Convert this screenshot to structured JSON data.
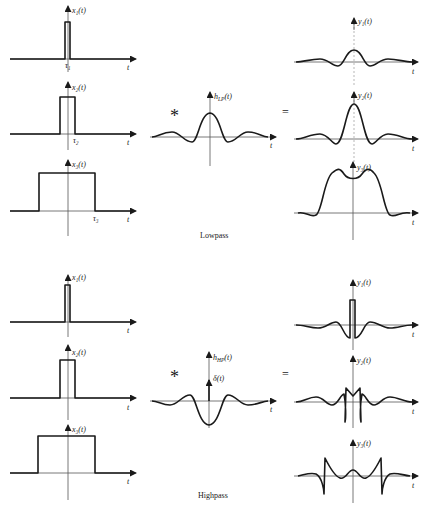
{
  "sections": [
    {
      "caption": "Lowpass",
      "inputs": [
        {
          "label": "x₁(t)",
          "tau_label": "τ₁",
          "t_label": "t"
        },
        {
          "label": "x₂(t)",
          "tau_label": "τ₂",
          "t_label": "t"
        },
        {
          "label": "x₃(t)",
          "tau_label": "τ₃",
          "t_label": "t"
        }
      ],
      "operator_convolve": "*",
      "operator_equals": "=",
      "filter": {
        "label": "h_LP(t)",
        "label_main": "h",
        "label_sub": "LP",
        "label_tail": "(t)",
        "t_label": "t"
      },
      "outputs": [
        {
          "label": "y₁(t)",
          "t_label": "t"
        },
        {
          "label": "y₂(t)",
          "t_label": "t"
        },
        {
          "label": "y₃(t)",
          "t_label": "t"
        }
      ]
    },
    {
      "caption": "Highpass",
      "inputs": [
        {
          "label": "x₁(t)",
          "t_label": "t"
        },
        {
          "label": "x₂(t)",
          "t_label": "t"
        },
        {
          "label": "x₃(t)",
          "t_label": "t"
        }
      ],
      "operator_convolve": "*",
      "operator_equals": "=",
      "filter": {
        "label": "h_HP(t)",
        "label_main": "h",
        "label_sub": "HP",
        "label_tail": "(t)",
        "impulse_label": "δ(t)",
        "t_label": "t"
      },
      "outputs": [
        {
          "label": "y₁(t)",
          "t_label": "t"
        },
        {
          "label": "y₂(t)",
          "t_label": "t"
        },
        {
          "label": "y₃(t)",
          "t_label": "t"
        }
      ]
    }
  ],
  "colors": {
    "ink": "#1a1a1a",
    "axis": "#555555",
    "background": "#ffffff"
  }
}
